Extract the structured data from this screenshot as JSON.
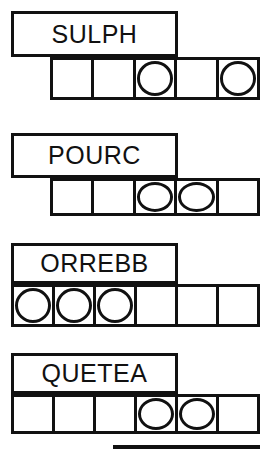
{
  "worksheet": {
    "title": "Word Puzzle Worksheet",
    "colors": {
      "ink": "#111111",
      "paper": "#ffffff"
    },
    "blocks": [
      {
        "id": "block-1",
        "word": "SULPH",
        "label_box": {
          "x": 11,
          "y": 11,
          "width": 167,
          "height": 46
        },
        "cell_strip": {
          "x": 50,
          "y": 57,
          "width": 210,
          "height": 43
        },
        "cell_count": 5,
        "circled_cells": [
          3,
          5
        ],
        "cells": [
          {
            "index": 1,
            "circled": false,
            "letter": ""
          },
          {
            "index": 2,
            "circled": false,
            "letter": ""
          },
          {
            "index": 3,
            "circled": true,
            "letter": ""
          },
          {
            "index": 4,
            "circled": false,
            "letter": ""
          },
          {
            "index": 5,
            "circled": true,
            "letter": ""
          }
        ]
      },
      {
        "id": "block-2",
        "word": "POURC",
        "label_box": {
          "x": 11,
          "y": 133,
          "width": 167,
          "height": 45
        },
        "cell_strip": {
          "x": 50,
          "y": 178,
          "width": 210,
          "height": 38
        },
        "cell_count": 5,
        "circled_cells": [
          3,
          4
        ],
        "cells": [
          {
            "index": 1,
            "circled": false,
            "letter": ""
          },
          {
            "index": 2,
            "circled": false,
            "letter": ""
          },
          {
            "index": 3,
            "circled": true,
            "letter": ""
          },
          {
            "index": 4,
            "circled": true,
            "letter": ""
          },
          {
            "index": 5,
            "circled": false,
            "letter": ""
          }
        ]
      },
      {
        "id": "block-3",
        "word": "ORREBB",
        "label_box": {
          "x": 11,
          "y": 243,
          "width": 167,
          "height": 41
        },
        "cell_strip": {
          "x": 11,
          "y": 284,
          "width": 249,
          "height": 43
        },
        "cell_count": 6,
        "circled_cells": [
          1,
          2,
          3
        ],
        "cells": [
          {
            "index": 1,
            "circled": true,
            "letter": ""
          },
          {
            "index": 2,
            "circled": true,
            "letter": ""
          },
          {
            "index": 3,
            "circled": true,
            "letter": ""
          },
          {
            "index": 4,
            "circled": false,
            "letter": ""
          },
          {
            "index": 5,
            "circled": false,
            "letter": ""
          },
          {
            "index": 6,
            "circled": false,
            "letter": ""
          }
        ]
      },
      {
        "id": "block-4",
        "word": "QUETEA",
        "label_box": {
          "x": 11,
          "y": 353,
          "width": 167,
          "height": 41
        },
        "cell_strip": {
          "x": 11,
          "y": 394,
          "width": 249,
          "height": 40
        },
        "cell_count": 6,
        "circled_cells": [
          4,
          5
        ],
        "cells": [
          {
            "index": 1,
            "circled": false,
            "letter": ""
          },
          {
            "index": 2,
            "circled": false,
            "letter": ""
          },
          {
            "index": 3,
            "circled": false,
            "letter": ""
          },
          {
            "index": 4,
            "circled": true,
            "letter": ""
          },
          {
            "index": 5,
            "circled": true,
            "letter": ""
          },
          {
            "index": 6,
            "circled": false,
            "letter": ""
          }
        ]
      }
    ],
    "partial_block": {
      "id": "block-5-partial",
      "x": 113,
      "y": 445,
      "width": 147,
      "height": 4
    }
  }
}
